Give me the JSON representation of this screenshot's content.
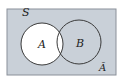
{
  "diagram": {
    "type": "venn",
    "universe_label": "S",
    "sets": [
      {
        "name": "A",
        "label": "A",
        "fill": "#ffffff"
      },
      {
        "name": "B",
        "label": "B",
        "fill": "#c9d0d8"
      }
    ],
    "shaded_region_label": "Ā",
    "shaded_region_meaning": "complement of A",
    "colors": {
      "shaded": "#c9d0d8",
      "unshaded": "#ffffff",
      "outline": "#3a3a3a"
    }
  }
}
